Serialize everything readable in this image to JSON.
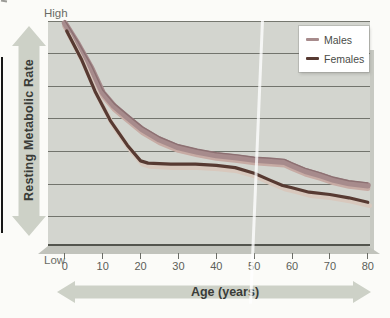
{
  "figure": {
    "y_axis": {
      "high_label": "High",
      "low_label": "Low",
      "title": "Resting Metabolic Rate"
    },
    "x_axis": {
      "title": "Age (years)",
      "ticks": [
        "0",
        "10",
        "20",
        "30",
        "40",
        "50",
        "60",
        "70",
        "80"
      ]
    },
    "legend": [
      {
        "label": "Males",
        "color": "#a78b8c"
      },
      {
        "label": "Females",
        "color": "#573a32"
      }
    ],
    "colors": {
      "plot_background": "#d3d5cf",
      "gridline": "#72746d",
      "arrow": "#cdd1c7",
      "males_line": "#a78b8c",
      "males_highlight": "#c7aba4",
      "males_dark_edge": "#8c7072",
      "females_line": "#573a32",
      "females_highlight": "#d8c8bd"
    }
  },
  "chart_data": {
    "type": "line",
    "title": "",
    "xlabel": "Age (years)",
    "ylabel": "Resting Metabolic Rate",
    "x_range": [
      0,
      80
    ],
    "ylim": [
      0,
      100
    ],
    "y_scale_note": "qualitative axis from Low (0) to High (100), relative units",
    "y_axis_labels": [
      "Low",
      "High"
    ],
    "grid": true,
    "legend_position": "top-right",
    "categories": [
      0,
      10,
      20,
      30,
      40,
      50,
      60,
      70,
      80
    ],
    "series": [
      {
        "name": "Males",
        "values_at_categories": [
          99,
          68.5,
          52,
          44,
          40.5,
          38.5,
          36,
          29.5,
          27
        ],
        "points": [
          [
            0,
            99.5
          ],
          [
            3.5,
            90
          ],
          [
            7,
            79.5
          ],
          [
            10,
            68.5
          ],
          [
            13,
            62.5
          ],
          [
            16.5,
            57.5
          ],
          [
            20.5,
            52
          ],
          [
            25,
            47.5
          ],
          [
            30,
            44
          ],
          [
            35,
            42
          ],
          [
            40,
            40.5
          ],
          [
            45.5,
            39.5
          ],
          [
            50,
            38.5
          ],
          [
            54.5,
            38
          ],
          [
            58,
            37.5
          ],
          [
            60,
            36
          ],
          [
            63.5,
            33.5
          ],
          [
            67.5,
            31.5
          ],
          [
            71,
            29.5
          ],
          [
            75,
            28
          ],
          [
            80,
            27
          ]
        ]
      },
      {
        "name": "Females",
        "values_at_categories": [
          96,
          64,
          38,
          36.5,
          36,
          32.5,
          26,
          23,
          19.5
        ],
        "points": [
          [
            0.5,
            96
          ],
          [
            4.5,
            83
          ],
          [
            8,
            69
          ],
          [
            12,
            56
          ],
          [
            16.5,
            45
          ],
          [
            20,
            38
          ],
          [
            22,
            37
          ],
          [
            28,
            36.5
          ],
          [
            34.5,
            36.5
          ],
          [
            40,
            36
          ],
          [
            45,
            35
          ],
          [
            50,
            32.5
          ],
          [
            54,
            29.5
          ],
          [
            57.5,
            27
          ],
          [
            60,
            26
          ],
          [
            64.5,
            24
          ],
          [
            70,
            23
          ],
          [
            75,
            21.5
          ],
          [
            80,
            19.5
          ]
        ]
      }
    ]
  }
}
